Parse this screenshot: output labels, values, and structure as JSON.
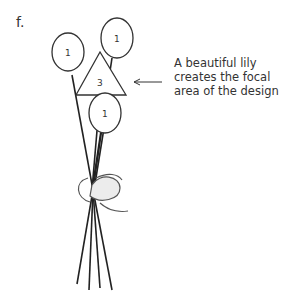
{
  "figure": {
    "label": "f.",
    "caption_lines": [
      "A beautiful lily",
      "creates the focal",
      "area of the design"
    ],
    "shapes": {
      "circle_left": "1",
      "circle_top_right": "1",
      "triangle": "3",
      "circle_bottom": "1"
    }
  }
}
